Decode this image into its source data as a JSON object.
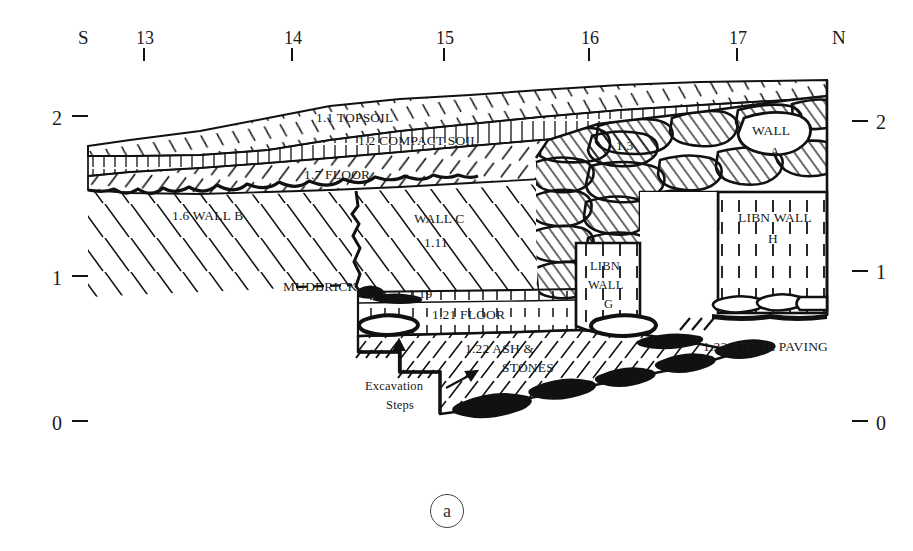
{
  "figure": {
    "type": "archaeological-section-drawing",
    "caption": "a",
    "compass": {
      "left": "S",
      "right": "N"
    },
    "vertical_axis": {
      "left_labels": [
        "2",
        "1",
        "0"
      ],
      "right_labels": [
        "2",
        "1",
        "0"
      ],
      "unit_implied": "metres"
    },
    "top_ruler": {
      "ticks": [
        "13",
        "14",
        "15",
        "16",
        "17"
      ]
    },
    "layer_labels": [
      {
        "id": "1.1",
        "text": "1.1 TOPSOIL"
      },
      {
        "id": "1.2",
        "text": "1.2 COMPACT SOIL"
      },
      {
        "id": "1.7",
        "text": "1.7 FLOOR"
      },
      {
        "id": "1.6",
        "text": "1.6 WALL B"
      },
      {
        "id": "1.11a",
        "text": "WALL C"
      },
      {
        "id": "1.11b",
        "text": "1.11"
      },
      {
        "id": "1.3",
        "text": "1.3"
      },
      {
        "id": "wallA1",
        "text": "WALL"
      },
      {
        "id": "wallA2",
        "text": "A"
      },
      {
        "id": "mud",
        "text": "MUDBRICK"
      },
      {
        "id": "1.19",
        "text": "1.19"
      },
      {
        "id": "1.21",
        "text": "1.21 FLOOR"
      },
      {
        "id": "1.22a",
        "text": "1.22 ASH &"
      },
      {
        "id": "1.22b",
        "text": "STONES"
      },
      {
        "id": "1.23",
        "text": "1.23 STONE PAVING"
      },
      {
        "id": "g1",
        "text": "LIBN"
      },
      {
        "id": "g2",
        "text": "WALL"
      },
      {
        "id": "g3",
        "text": "G"
      },
      {
        "id": "h1",
        "text": "LIBN WALL"
      },
      {
        "id": "h2",
        "text": "H"
      },
      {
        "id": "exc1",
        "text": "Excavation"
      },
      {
        "id": "exc2",
        "text": "Steps"
      }
    ],
    "colors": {
      "ink": "#111111",
      "paper": "#ffffff",
      "caption_ink": "#333333"
    }
  }
}
